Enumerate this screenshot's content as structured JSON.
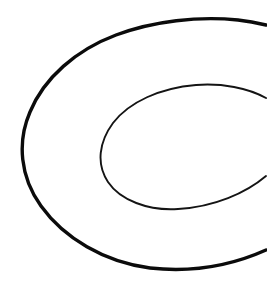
{
  "figure": {
    "kind": "line-drawing",
    "background_color": "#ffffff",
    "canvas_width": 267,
    "canvas_height": 285,
    "shapes": [
      {
        "name": "outer-c-curve",
        "role": "outer open elliptical arc",
        "stroke_color": "#0b0b0b",
        "stroke_width": 3.4,
        "center_x": 152,
        "center_y": 146,
        "radius_x": 130,
        "radius_y": 124,
        "rotation_deg": -9,
        "leftmost_x": 23,
        "leftmost_y": 150,
        "topmost_x": 215,
        "topmost_y": 22,
        "bottommost_x": 150,
        "bottommost_y": 268,
        "right_edge_crossings_y": [
          20,
          250
        ],
        "open_side": "right",
        "path": "M 266 250 C 226 268 186 272 150 268 C 104 262 64 238 41 206 C 20 177 17 142 30 112 C 44 78 76 50 116 35 C 154 21 198 16 238 20 C 248 21 258 23 266 25"
      },
      {
        "name": "inner-c-curve",
        "role": "inner open elliptical arc",
        "stroke_color": "#141414",
        "stroke_width": 1.9,
        "center_x": 190,
        "center_y": 147,
        "radius_x": 90,
        "radius_y": 63,
        "rotation_deg": -11,
        "leftmost_x": 101,
        "leftmost_y": 150,
        "topmost_x": 200,
        "topmost_y": 85,
        "bottommost_x": 178,
        "bottommost_y": 209,
        "right_edge_crossings_y": [
          100,
          175
        ],
        "open_side": "right",
        "path": "M 266 176 C 246 193 214 207 178 209 C 148 211 120 200 108 182 C 96 164 99 142 113 123 C 129 102 160 88 196 85 C 222 83 248 88 266 98"
      }
    ]
  }
}
